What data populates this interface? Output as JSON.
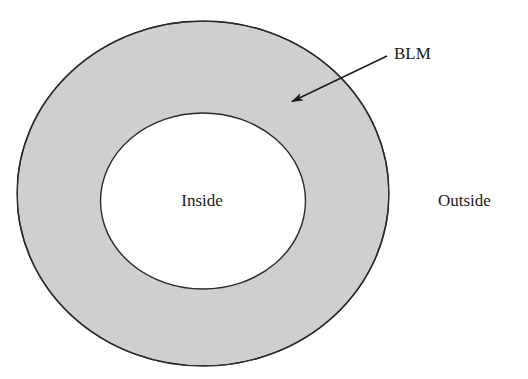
{
  "diagram": {
    "regions": {
      "membrane": {
        "name": "BLM",
        "fill": "#d3d3d3",
        "stroke": "#2a2a2a"
      },
      "inside": {
        "label": "Inside",
        "fill": "#ffffff"
      },
      "outside": {
        "label": "Outside"
      }
    },
    "annotations": [
      {
        "text": "BLM",
        "points_to": "membrane",
        "shape": "arrow"
      }
    ]
  }
}
